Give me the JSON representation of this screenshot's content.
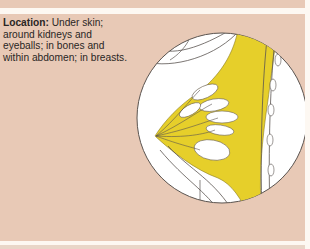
{
  "caption": {
    "label": "Location:",
    "text": " Under skin; around kidneys and eyeballs; in bones and within abdomen; in breasts."
  },
  "illustration": {
    "subject": "breast cross-section showing adipose tissue",
    "colors": {
      "background": "#e8c9b6",
      "fat": "#e6cf2a",
      "tissue": "#ffffff",
      "outline": "#5a5450"
    }
  }
}
